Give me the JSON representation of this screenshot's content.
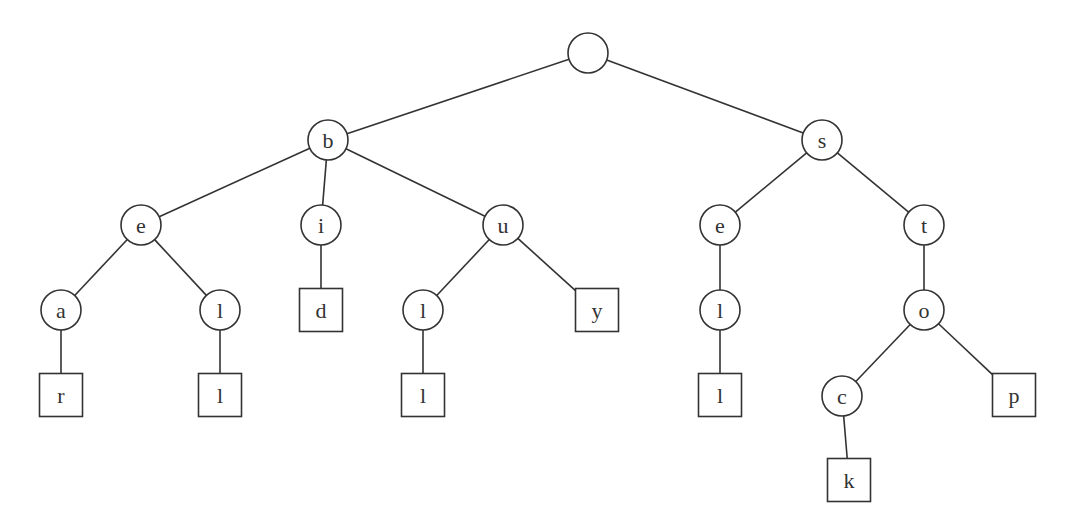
{
  "diagram": {
    "type": "trie",
    "node_radius": 20,
    "box_size": 43,
    "colors": {
      "stroke": "#333333",
      "fill": "#ffffff",
      "text": "#333333"
    },
    "nodes": [
      {
        "id": "root",
        "label": "",
        "shape": "circle",
        "x": 588,
        "y": 53
      },
      {
        "id": "b",
        "label": "b",
        "shape": "circle",
        "x": 328,
        "y": 140
      },
      {
        "id": "s",
        "label": "s",
        "shape": "circle",
        "x": 822,
        "y": 140
      },
      {
        "id": "b-e",
        "label": "e",
        "shape": "circle",
        "x": 141,
        "y": 225
      },
      {
        "id": "b-i",
        "label": "i",
        "shape": "circle",
        "x": 321,
        "y": 225
      },
      {
        "id": "b-u",
        "label": "u",
        "shape": "circle",
        "x": 503,
        "y": 225
      },
      {
        "id": "s-e",
        "label": "e",
        "shape": "circle",
        "x": 720,
        "y": 225
      },
      {
        "id": "s-t",
        "label": "t",
        "shape": "circle",
        "x": 924,
        "y": 225
      },
      {
        "id": "be-a",
        "label": "a",
        "shape": "circle",
        "x": 61,
        "y": 310
      },
      {
        "id": "be-l",
        "label": "l",
        "shape": "circle",
        "x": 220,
        "y": 310
      },
      {
        "id": "bi-d",
        "label": "d",
        "shape": "box",
        "x": 321,
        "y": 310
      },
      {
        "id": "bu-l",
        "label": "l",
        "shape": "circle",
        "x": 423,
        "y": 310
      },
      {
        "id": "bu-y",
        "label": "y",
        "shape": "box",
        "x": 597,
        "y": 310
      },
      {
        "id": "se-l",
        "label": "l",
        "shape": "circle",
        "x": 720,
        "y": 310
      },
      {
        "id": "st-o",
        "label": "o",
        "shape": "circle",
        "x": 924,
        "y": 310
      },
      {
        "id": "bea-r",
        "label": "r",
        "shape": "box",
        "x": 61,
        "y": 395
      },
      {
        "id": "bel-l",
        "label": "l",
        "shape": "box",
        "x": 220,
        "y": 395
      },
      {
        "id": "bul-l",
        "label": "l",
        "shape": "box",
        "x": 423,
        "y": 395
      },
      {
        "id": "sel-l",
        "label": "l",
        "shape": "box",
        "x": 720,
        "y": 395
      },
      {
        "id": "sto-c",
        "label": "c",
        "shape": "circle",
        "x": 842,
        "y": 396
      },
      {
        "id": "sto-p",
        "label": "p",
        "shape": "box",
        "x": 1014,
        "y": 395
      },
      {
        "id": "stoc-k",
        "label": "k",
        "shape": "box",
        "x": 849,
        "y": 480
      }
    ],
    "edges": [
      [
        "root",
        "b"
      ],
      [
        "root",
        "s"
      ],
      [
        "b",
        "b-e"
      ],
      [
        "b",
        "b-i"
      ],
      [
        "b",
        "b-u"
      ],
      [
        "s",
        "s-e"
      ],
      [
        "s",
        "s-t"
      ],
      [
        "b-e",
        "be-a"
      ],
      [
        "b-e",
        "be-l"
      ],
      [
        "b-i",
        "bi-d"
      ],
      [
        "b-u",
        "bu-l"
      ],
      [
        "b-u",
        "bu-y"
      ],
      [
        "s-e",
        "se-l"
      ],
      [
        "s-t",
        "st-o"
      ],
      [
        "be-a",
        "bea-r"
      ],
      [
        "be-l",
        "bel-l"
      ],
      [
        "bu-l",
        "bul-l"
      ],
      [
        "se-l",
        "sel-l"
      ],
      [
        "st-o",
        "sto-c"
      ],
      [
        "st-o",
        "sto-p"
      ],
      [
        "sto-c",
        "stoc-k"
      ]
    ],
    "words": [
      "bear",
      "bell",
      "bid",
      "bull",
      "buy",
      "sell",
      "stock",
      "stop"
    ]
  }
}
